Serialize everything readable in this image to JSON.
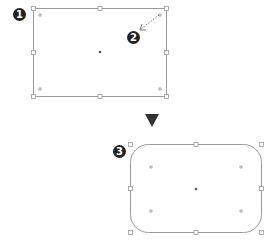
{
  "diagram": {
    "steps": [
      {
        "label": "1",
        "shape": "rectangle",
        "state": "selected, sharp corners"
      },
      {
        "label": "2",
        "shape": "corner-radius-widget-drag",
        "state": "drag inward from top-right widget"
      },
      {
        "label": "3",
        "shape": "rounded-rectangle",
        "state": "result with rounded corners"
      }
    ],
    "arrow": {
      "direction": "down",
      "color": "#333333"
    },
    "colors": {
      "stroke": "#999999",
      "label_bg": "#222222",
      "label_fg": "#ffffff",
      "widget": "#aaaaaa",
      "center": "#555555"
    }
  }
}
